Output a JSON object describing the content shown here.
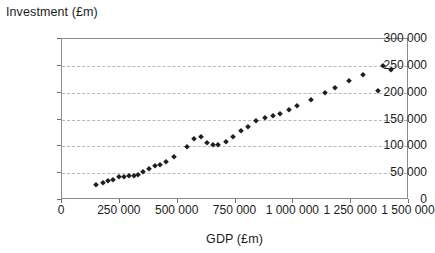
{
  "chart_data": {
    "type": "scatter",
    "title": "",
    "xlabel": "GDP (£m)",
    "ylabel": "Investment (£m)",
    "xlim": [
      0,
      1500000
    ],
    "ylim": [
      0,
      300000
    ],
    "grid": true,
    "legend": "none",
    "marker": "diamond",
    "marker_color": "#1f1f1f",
    "x_ticks": [
      0,
      250000,
      500000,
      750000,
      1000000,
      1250000,
      1500000
    ],
    "x_tick_labels": [
      "0",
      "250 000",
      "500 000",
      "750 000",
      "1 000 000",
      "1 250 000",
      "1 500 000"
    ],
    "y_ticks": [
      0,
      50000,
      100000,
      150000,
      200000,
      250000,
      300000
    ],
    "y_tick_labels": [
      "0",
      "50 000",
      "100 000",
      "150 000",
      "200 000",
      "250 000",
      "300 000"
    ],
    "points": [
      {
        "x": 148000,
        "y": 28000
      },
      {
        "x": 176000,
        "y": 31000
      },
      {
        "x": 199000,
        "y": 35000
      },
      {
        "x": 222000,
        "y": 38000
      },
      {
        "x": 245000,
        "y": 43000
      },
      {
        "x": 268000,
        "y": 43000
      },
      {
        "x": 288000,
        "y": 44000
      },
      {
        "x": 310000,
        "y": 45000
      },
      {
        "x": 330000,
        "y": 47000
      },
      {
        "x": 352000,
        "y": 52000
      },
      {
        "x": 376000,
        "y": 58000
      },
      {
        "x": 402000,
        "y": 64000
      },
      {
        "x": 424000,
        "y": 66000
      },
      {
        "x": 448000,
        "y": 70000
      },
      {
        "x": 486000,
        "y": 81000
      },
      {
        "x": 540000,
        "y": 99000
      },
      {
        "x": 570000,
        "y": 113000
      },
      {
        "x": 602000,
        "y": 117000
      },
      {
        "x": 628000,
        "y": 106000
      },
      {
        "x": 652000,
        "y": 103000
      },
      {
        "x": 676000,
        "y": 102000
      },
      {
        "x": 708000,
        "y": 108000
      },
      {
        "x": 740000,
        "y": 117000
      },
      {
        "x": 772000,
        "y": 128000
      },
      {
        "x": 806000,
        "y": 136000
      },
      {
        "x": 840000,
        "y": 148000
      },
      {
        "x": 876000,
        "y": 153000
      },
      {
        "x": 910000,
        "y": 156000
      },
      {
        "x": 944000,
        "y": 160000
      },
      {
        "x": 980000,
        "y": 167000
      },
      {
        "x": 1018000,
        "y": 175000
      },
      {
        "x": 1076000,
        "y": 186000
      },
      {
        "x": 1136000,
        "y": 199000
      },
      {
        "x": 1178000,
        "y": 208000
      },
      {
        "x": 1240000,
        "y": 221000
      },
      {
        "x": 1302000,
        "y": 233000
      },
      {
        "x": 1366000,
        "y": 204000
      },
      {
        "x": 1386000,
        "y": 250000
      },
      {
        "x": 1424000,
        "y": 242000
      }
    ]
  }
}
